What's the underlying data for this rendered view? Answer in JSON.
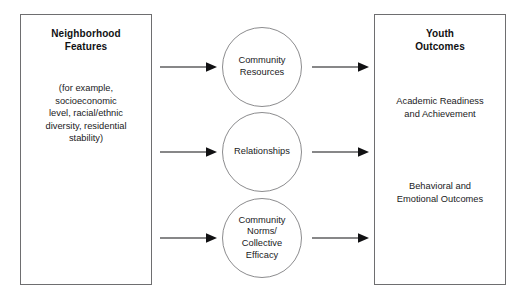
{
  "diagram": {
    "left_panel": {
      "heading": "Neighborhood\nFeatures",
      "body": "(for example,\nsocioeconomic\nlevel, racial/ethnic\ndiversity, residential\nstability)"
    },
    "mediators": [
      {
        "label": "Community\nResources"
      },
      {
        "label": "Relationships"
      },
      {
        "label": "Community\nNorms/\nCollective\nEfficacy"
      }
    ],
    "right_panel": {
      "heading": "Youth\nOutcomes",
      "outcome_1": "Academic Readiness\nand Achievement",
      "outcome_2": "Behavioral and\nEmotional Outcomes"
    },
    "arrows": {
      "left": [
        "arrow-to-community-resources",
        "arrow-to-relationships",
        "arrow-to-community-norms"
      ],
      "right": [
        "arrow-from-community-resources",
        "arrow-from-relationships",
        "arrow-from-community-norms"
      ]
    },
    "colors": {
      "background": "#ffffff",
      "box_border": "#6e6e70",
      "circle_border": "#8c8c8e",
      "text": "#1a1a1c",
      "heading_text": "#111113",
      "arrow": "#111113"
    }
  }
}
